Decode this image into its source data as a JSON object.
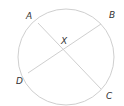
{
  "diagram": {
    "circle": {
      "cx": 66,
      "cy": 57,
      "r": 48,
      "stroke": "#cfcfcf"
    },
    "chords": [
      {
        "from": "A",
        "to": "C",
        "x1": 38,
        "y1": 23,
        "x2": 101,
        "y2": 89
      },
      {
        "from": "B",
        "to": "D",
        "x1": 101,
        "y1": 24,
        "x2": 28,
        "y2": 73
      }
    ],
    "labels": {
      "A": "A",
      "B": "B",
      "C": "C",
      "D": "D",
      "X": "X"
    },
    "line_color": "#cfcfcf",
    "text_color": "#333333"
  }
}
